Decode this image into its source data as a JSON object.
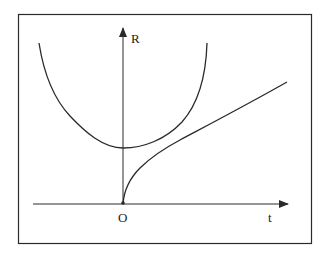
{
  "diagram": {
    "type": "function-graph",
    "axes": {
      "x_label": "t",
      "y_label": "R",
      "origin_label": "O"
    },
    "curves": [
      {
        "name": "parabola-curve",
        "description": "U-shaped curve with minimum on the R axis above origin"
      },
      {
        "name": "sqrt-growth-curve",
        "description": "curve starting at origin, rising steeply then growing slowly to the right"
      }
    ],
    "colors": {
      "stroke": "#2a2a2a",
      "background": "#ffffff",
      "frame": "#2a2a2a"
    }
  }
}
